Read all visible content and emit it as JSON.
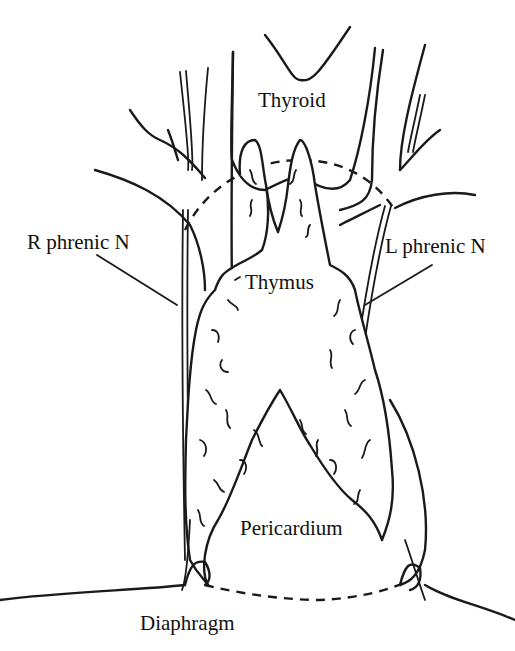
{
  "diagram": {
    "type": "anatomical-illustration",
    "colors": {
      "line": "#1a1a1a",
      "background": "#ffffff"
    },
    "labels": {
      "thyroid": "Thyroid",
      "r_phrenic": "R phrenic N",
      "l_phrenic": "L phrenic N",
      "thymus": "Thymus",
      "pericardium": "Pericardium",
      "diaphragm": "Diaphragm"
    }
  }
}
